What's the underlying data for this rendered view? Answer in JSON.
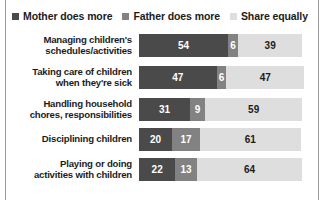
{
  "legend": {
    "entries": [
      {
        "label": "Mother does more",
        "color": "#4a4a4a",
        "icon": "legend-square-icon"
      },
      {
        "label": "Father does more",
        "color": "#828282",
        "icon": "legend-square-icon"
      },
      {
        "label": "Share equally",
        "color": "#dedede",
        "icon": "legend-square-icon"
      }
    ]
  },
  "chart_data": {
    "type": "bar",
    "title": "",
    "subtitle": "",
    "xlabel": "",
    "ylabel": "",
    "orientation": "horizontal",
    "stacked": true,
    "normalized_percent": true,
    "xlim": [
      0,
      100
    ],
    "grid": false,
    "legend_position": "top-left",
    "categories": [
      "Managing children's schedules/activities",
      "Taking care of children when they're sick",
      "Handling household chores, responsibilities",
      "Disciplining children",
      "Playing or doing activities with children"
    ],
    "category_lines": [
      [
        "Managing children's",
        "schedules/activities"
      ],
      [
        "Taking care of children",
        "when they're sick"
      ],
      [
        "Handling household",
        "chores, responsibilities"
      ],
      [
        "Disciplining children"
      ],
      [
        "Playing or doing",
        "activities with children"
      ]
    ],
    "series": [
      {
        "name": "Mother does more",
        "color": "#4a4a4a",
        "values": [
          54,
          47,
          31,
          20,
          22
        ]
      },
      {
        "name": "Father does more",
        "color": "#828282",
        "values": [
          6,
          6,
          9,
          17,
          13
        ]
      },
      {
        "name": "Share equally",
        "color": "#dedede",
        "values": [
          39,
          47,
          59,
          61,
          64
        ]
      }
    ],
    "rows": [
      {
        "label_lines": [
          "Managing children's",
          "schedules/activities"
        ],
        "mother": 54,
        "father": 6,
        "equally": 39
      },
      {
        "label_lines": [
          "Taking care of children",
          "when they're sick"
        ],
        "mother": 47,
        "father": 6,
        "equally": 47
      },
      {
        "label_lines": [
          "Handling household",
          "chores, responsibilities"
        ],
        "mother": 31,
        "father": 9,
        "equally": 59
      },
      {
        "label_lines": [
          "Disciplining children"
        ],
        "mother": 20,
        "father": 17,
        "equally": 61
      },
      {
        "label_lines": [
          "Playing or doing",
          "activities with children"
        ],
        "mother": 22,
        "father": 13,
        "equally": 64
      }
    ]
  }
}
